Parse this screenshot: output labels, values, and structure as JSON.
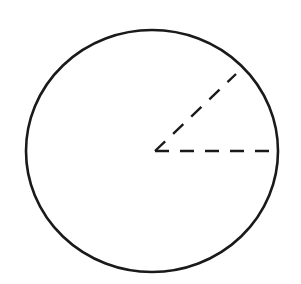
{
  "figure": {
    "background_color": "#ffffff",
    "width": 301,
    "height": 284
  },
  "chart_data": {
    "type": "diagram",
    "subtype": "geometry-circle-angle",
    "title": "",
    "xlabel": "",
    "ylabel": "",
    "grid": false,
    "legend": null,
    "annotations": [],
    "tick_labels": [],
    "canvas": {
      "width": 301,
      "height": 284,
      "background": "#ffffff"
    },
    "shapes": [
      {
        "name": "circle-outline",
        "type": "ellipse",
        "cx": 152,
        "cy": 151,
        "rx": 126,
        "ry": 121,
        "stroke": "#1a1a1a",
        "stroke_width": 2.6,
        "fill": "none",
        "dashed": false
      },
      {
        "name": "radius-horizontal",
        "type": "line",
        "x1": 155,
        "y1": 151,
        "x2": 278,
        "y2": 151,
        "stroke": "#1a1a1a",
        "stroke_width": 2.4,
        "dashed": true,
        "dash_length": 14,
        "dash_gap": 11,
        "angle_degrees": 0,
        "length": 123
      },
      {
        "name": "radius-diagonal",
        "type": "line",
        "x1": 155,
        "y1": 151,
        "x2": 236,
        "y2": 74,
        "stroke": "#1a1a1a",
        "stroke_width": 2.4,
        "dashed": true,
        "dash_length": 14,
        "dash_gap": 11,
        "angle_degrees": 43.5,
        "length": 112
      }
    ],
    "vertex": {
      "name": "angle-vertex",
      "x": 155,
      "y": 151
    },
    "angle_between_radii_degrees": 43.5,
    "colors": {
      "stroke": "#1a1a1a",
      "background": "#ffffff"
    }
  }
}
